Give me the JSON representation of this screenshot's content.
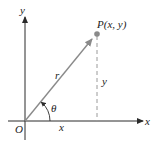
{
  "diagram": {
    "labels": {
      "y_axis": "y",
      "x_axis": "x",
      "origin": "O",
      "point": "P(x, y)",
      "radius": "r",
      "angle": "θ",
      "x_leg": "x",
      "y_leg": "y"
    },
    "colors": {
      "axis": "#2a2a2a",
      "vector": "#8a8a8a",
      "point": "#8a8a8a",
      "dashed": "#9a9a9a",
      "text": "#222222"
    }
  }
}
